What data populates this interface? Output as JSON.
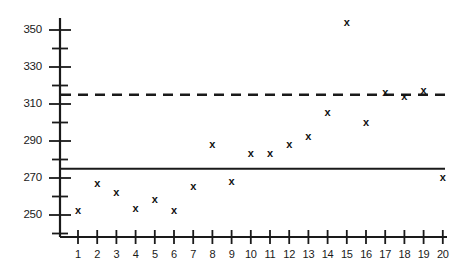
{
  "chart_data": {
    "type": "scatter",
    "title": "",
    "subtitle": "",
    "xlabel": "",
    "ylabel": "",
    "x": [
      1,
      2,
      3,
      4,
      5,
      6,
      7,
      8,
      9,
      10,
      11,
      12,
      13,
      14,
      15,
      16,
      17,
      18,
      19,
      20
    ],
    "values": [
      252,
      267,
      262,
      253,
      258,
      252,
      265,
      288,
      268,
      283,
      283,
      288,
      292,
      305,
      354,
      300,
      316,
      314,
      317,
      270
    ],
    "series": [
      {
        "name": "observations",
        "marker": "x",
        "values": [
          252,
          267,
          262,
          253,
          258,
          252,
          265,
          288,
          268,
          283,
          283,
          288,
          292,
          305,
          354,
          300,
          316,
          314,
          317,
          270
        ]
      }
    ],
    "xlim": [
      0.4,
      20.9
    ],
    "ylim": [
      243,
      358
    ],
    "xticks": [
      1,
      2,
      3,
      4,
      5,
      6,
      7,
      8,
      9,
      10,
      11,
      12,
      13,
      14,
      15,
      16,
      17,
      18,
      19,
      20
    ],
    "xtick_labels": [
      "1",
      "2",
      "3",
      "4",
      "5",
      "6",
      "7",
      "8",
      "9",
      "10",
      "11",
      "12",
      "13",
      "14",
      "15",
      "16",
      "17",
      "18",
      "19",
      "20"
    ],
    "yticks_major": [
      250,
      270,
      290,
      310,
      330,
      350
    ],
    "ytick_labels": [
      "250",
      "270",
      "290",
      "310",
      "330",
      "350"
    ],
    "yticks_minor": [
      260,
      280,
      300,
      320,
      340
    ],
    "grid": false,
    "legend": false,
    "legend_position": "none",
    "reference_lines": [
      {
        "name": "solid-reference-line",
        "value": 275,
        "style": "solid",
        "color": "#1a1a1a",
        "label": ""
      },
      {
        "name": "dashed-reference-line",
        "value": 315,
        "style": "dashed",
        "color": "#1a1a1a",
        "label": ""
      }
    ],
    "colors": {
      "marker": "#111111",
      "axis": "#1a1a1a",
      "background": "#ffffff"
    }
  },
  "axes": {
    "y_labels": [
      "350",
      "330",
      "310",
      "290",
      "270",
      "250"
    ],
    "x_labels": [
      "1",
      "2",
      "3",
      "4",
      "5",
      "6",
      "7",
      "8",
      "9",
      "10",
      "11",
      "12",
      "13",
      "14",
      "15",
      "16",
      "17",
      "18",
      "19",
      "20"
    ]
  },
  "markers": {
    "glyph": "x"
  }
}
